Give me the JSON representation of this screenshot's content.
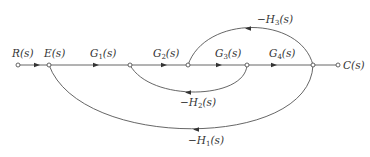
{
  "diagram": {
    "type": "signal-flow-graph",
    "nodes": [
      {
        "id": "R",
        "label": "R(s)",
        "x": 18,
        "y": 65
      },
      {
        "id": "E",
        "label": "E(s)",
        "x": 49,
        "y": 65
      },
      {
        "id": "N2",
        "label": "",
        "x": 130,
        "y": 65
      },
      {
        "id": "N3",
        "label": "",
        "x": 188,
        "y": 65
      },
      {
        "id": "N4",
        "label": "",
        "x": 247,
        "y": 65
      },
      {
        "id": "N5",
        "label": "",
        "x": 313,
        "y": 65
      },
      {
        "id": "C",
        "label": "C(s)",
        "x": 338,
        "y": 65
      }
    ],
    "labels": {
      "R": {
        "main": "R",
        "arg": "(s)"
      },
      "E": {
        "main": "E",
        "arg": "(s)"
      },
      "C": {
        "main": "C",
        "arg": "(s)"
      },
      "G1": {
        "main": "G",
        "sub": "1",
        "arg": "(s)"
      },
      "G2": {
        "main": "G",
        "sub": "2",
        "arg": "(s)"
      },
      "G3": {
        "main": "G",
        "sub": "3",
        "arg": "(s)"
      },
      "G4": {
        "main": "G",
        "sub": "4",
        "arg": "(s)"
      },
      "H1": {
        "main": "−H",
        "sub": "1",
        "arg": "(s)"
      },
      "H2": {
        "main": "−H",
        "sub": "2",
        "arg": "(s)"
      },
      "H3": {
        "main": "−H",
        "sub": "3",
        "arg": "(s)"
      }
    },
    "edges": [
      {
        "from": "R",
        "to": "E",
        "gain": "1"
      },
      {
        "from": "E",
        "to": "N2",
        "gain": "G1(s)"
      },
      {
        "from": "N2",
        "to": "N3",
        "gain": "G2(s)"
      },
      {
        "from": "N3",
        "to": "N4",
        "gain": "G3(s)"
      },
      {
        "from": "N4",
        "to": "N5",
        "gain": "G4(s)"
      },
      {
        "from": "N5",
        "to": "C",
        "gain": "1"
      },
      {
        "from": "N5",
        "to": "N3",
        "gain": "-H3(s)",
        "kind": "feedback-upper"
      },
      {
        "from": "N4",
        "to": "N2",
        "gain": "-H2(s)",
        "kind": "feedback-lower"
      },
      {
        "from": "N5",
        "to": "E",
        "gain": "-H1(s)",
        "kind": "feedback-outer"
      }
    ]
  }
}
